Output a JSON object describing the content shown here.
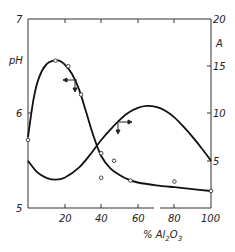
{
  "chart_data": {
    "type": "line",
    "title": "",
    "xlabel": "% Al2O3",
    "xlabel_parts": {
      "pre": "% Al",
      "sub1": "2",
      "mid": "O",
      "sub2": "3"
    },
    "ylabel_left": "pH",
    "ylabel_right": "A",
    "xlim": [
      0,
      100
    ],
    "ylim_left": [
      5,
      7
    ],
    "ylim_right": [
      0,
      20
    ],
    "x_ticks": [
      "20",
      "40",
      "60",
      "80",
      "100"
    ],
    "x_tick_values": [
      20,
      40,
      60,
      80,
      100
    ],
    "y_left_ticks": [
      "5",
      "6",
      "7"
    ],
    "y_left_tick_values": [
      5,
      6,
      7
    ],
    "y_right_ticks": [
      "5",
      "10",
      "15",
      "20"
    ],
    "y_right_tick_values": [
      5,
      10,
      15,
      20
    ],
    "grid": false,
    "series": [
      {
        "name": "pH",
        "axis": "left",
        "curve_x": [
          0,
          3,
          6,
          10,
          14,
          17,
          20,
          24,
          28,
          32,
          36,
          40,
          45,
          50,
          55,
          60,
          70,
          80,
          90,
          100
        ],
        "curve_y": [
          5.75,
          6.15,
          6.38,
          6.52,
          6.56,
          6.56,
          6.52,
          6.42,
          6.25,
          6.0,
          5.75,
          5.55,
          5.42,
          5.35,
          5.3,
          5.27,
          5.24,
          5.22,
          5.2,
          5.18
        ],
        "points_x": [
          0,
          15,
          22,
          29,
          40,
          56,
          80,
          100
        ],
        "points_y": [
          5.72,
          6.56,
          6.5,
          6.2,
          5.32,
          5.29,
          5.28,
          5.18
        ]
      },
      {
        "name": "A",
        "axis": "right",
        "curve_x": [
          0,
          5,
          10,
          15,
          20,
          28,
          35,
          40,
          45,
          50,
          55,
          60,
          65,
          70,
          75,
          80,
          85,
          90,
          95,
          100
        ],
        "curve_y": [
          5.0,
          3.8,
          3.2,
          3.0,
          3.2,
          4.3,
          5.9,
          7.2,
          8.3,
          9.3,
          10.1,
          10.6,
          10.8,
          10.7,
          10.3,
          9.6,
          8.6,
          7.5,
          6.3,
          5.0
        ],
        "points_x": [
          40,
          47
        ],
        "points_y": [
          5.8,
          5.0
        ]
      }
    ],
    "annotations": [
      {
        "type": "arrow",
        "direction": "left",
        "series": "pH",
        "x": 29,
        "y_left": 6.32
      },
      {
        "type": "arrow",
        "direction": "right",
        "series": "A",
        "x": 50,
        "y_right": 9.0
      }
    ]
  },
  "labels": {
    "ph_axis": "pH",
    "a_axis": "A",
    "x_axis_pre": "% Al",
    "x_axis_sub1": "2",
    "x_axis_mid": "O",
    "x_axis_sub2": "3",
    "yl_5": "5",
    "yl_6": "6",
    "yl_7": "7",
    "yr_5": "5",
    "yr_10": "10",
    "yr_15": "15",
    "yr_20": "20",
    "x_20": "20",
    "x_40": "40",
    "x_60": "60",
    "x_80": "80",
    "x_100": "100"
  }
}
